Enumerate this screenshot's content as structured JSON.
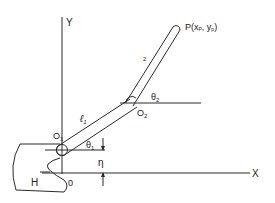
{
  "diagram": {
    "axes": {
      "y_label": "Y",
      "x_label": "X",
      "origin_label": "0"
    },
    "joints": {
      "o1": "O",
      "o1_sub": "1",
      "o2": "O",
      "o2_sub": "2"
    },
    "links": {
      "l1": "ℓ",
      "l1_sub": "1",
      "l2": "2"
    },
    "angles": {
      "theta1": "θ",
      "theta1_sub": "1",
      "theta2": "θ",
      "theta2_sub": "2"
    },
    "offset": {
      "eta": "η"
    },
    "body": {
      "label": "H"
    },
    "endpoint": {
      "label": "P(x",
      "xsub": "P",
      "mid": ", y",
      "ysub": "p",
      "end": ")"
    },
    "colors": {
      "stroke": "#2a2a2a",
      "text": "#222222",
      "background": "#ffffff"
    }
  }
}
